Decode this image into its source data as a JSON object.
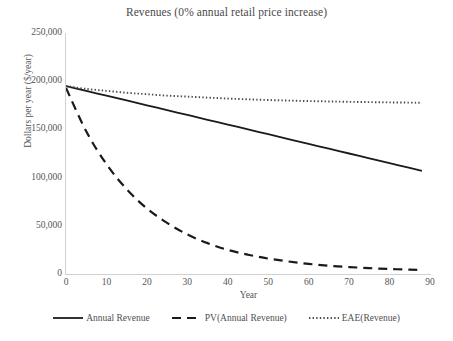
{
  "chart_data": {
    "type": "line",
    "title": "Revenues (0% annual retail price increase)",
    "xlabel": "Year",
    "ylabel": "Dollars per year ($/year)",
    "xlim": [
      0,
      90
    ],
    "ylim": [
      0,
      250000
    ],
    "xticks": [
      "0",
      "10",
      "20",
      "30",
      "40",
      "50",
      "60",
      "70",
      "80",
      "90"
    ],
    "yticks": [
      "0",
      "50,000",
      "100,000",
      "150,000",
      "200,000",
      "250,000"
    ],
    "ytick_values": [
      0,
      50000,
      100000,
      150000,
      200000,
      250000
    ],
    "xtick_values": [
      0,
      10,
      20,
      30,
      40,
      50,
      60,
      70,
      80,
      90
    ],
    "grid": false,
    "legend_position": "bottom",
    "x": [
      0,
      5,
      10,
      15,
      20,
      25,
      30,
      35,
      40,
      45,
      50,
      55,
      60,
      65,
      70,
      75,
      80,
      85,
      88
    ],
    "series": [
      {
        "name": "Annual Revenue",
        "style": "solid",
        "color": "#1a1a1a",
        "values": [
          195000,
          190000,
          185000,
          180000,
          175000,
          170000,
          165000,
          160000,
          155000,
          150000,
          145000,
          140000,
          135000,
          130000,
          125000,
          120000,
          115000,
          110000,
          107000
        ]
      },
      {
        "name": "PV(Annual Revenue)",
        "style": "dashed",
        "color": "#1a1a1a",
        "values": [
          193000,
          148000,
          114000,
          88000,
          68000,
          53000,
          41000,
          32000,
          25000,
          20000,
          16000,
          13000,
          10500,
          8600,
          7200,
          6100,
          5200,
          4500,
          4200
        ]
      },
      {
        "name": "EAE(Revenue)",
        "style": "dotted",
        "color": "#4a4a4a",
        "values": [
          195000,
          192000,
          190000,
          188000,
          186500,
          185000,
          184000,
          183000,
          182000,
          181200,
          180500,
          179900,
          179400,
          179000,
          178600,
          178300,
          178000,
          177800,
          177600
        ]
      }
    ]
  },
  "legend": {
    "items": [
      {
        "label": "Annual Revenue",
        "style": "solid"
      },
      {
        "label": "PV(Annual Revenue)",
        "style": "dashed"
      },
      {
        "label": "EAE(Revenue)",
        "style": "dotted"
      }
    ]
  }
}
